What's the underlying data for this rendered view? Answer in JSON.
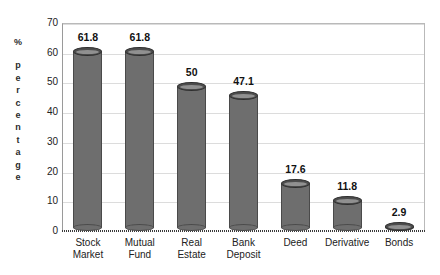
{
  "chart_data": {
    "type": "bar",
    "title": "",
    "subtitle": "",
    "xlabel": "",
    "ylabel": "% percentage",
    "ylim": [
      0,
      70
    ],
    "ytick_labels": [
      "70",
      "60",
      "50",
      "40",
      "30",
      "20",
      "10",
      "0"
    ],
    "ytick_values": [
      70,
      60,
      50,
      40,
      30,
      20,
      10,
      0
    ],
    "grid": true,
    "legend": null,
    "categories": [
      "Stock\nMarket",
      "Mutual\nFund",
      "Real\nEstate",
      "Bank\nDeposit",
      "Deed",
      "Derivative",
      "Bonds"
    ],
    "values": [
      61.8,
      61.8,
      50,
      47.1,
      17.6,
      11.8,
      2.9
    ],
    "value_labels": [
      "61.8",
      "61.8",
      "50",
      "47.1",
      "17.6",
      "11.8",
      "2.9"
    ],
    "bar_style": "cylinder",
    "colors": {
      "bar_fill": "#b2b2b2",
      "bar_hatch": "#6e6e6e",
      "bar_edge": "#4a4a4a",
      "cap_top_fill": "#8f8f8f",
      "grid": "#dcdcdc",
      "axis": "#9a9a9a",
      "text": "#1a1a1a",
      "background": "#ffffff"
    }
  },
  "y_axis_title": {
    "symbol": "%",
    "letters": [
      "p",
      "e",
      "r",
      "c",
      "e",
      "n",
      "t",
      "a",
      "g",
      "e"
    ]
  }
}
